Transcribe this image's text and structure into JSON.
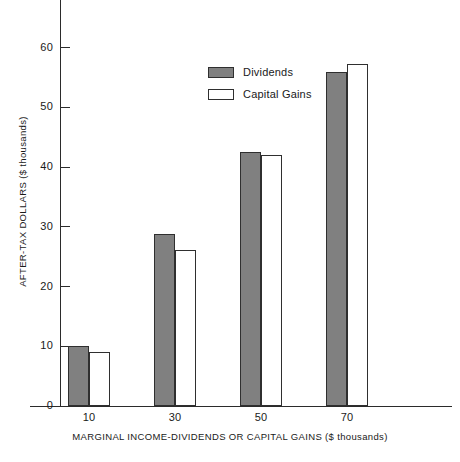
{
  "chart_data": {
    "type": "bar",
    "title": "",
    "subtitle": "",
    "xlabel": "MARGINAL INCOME-DIVIDENDS OR CAPITAL GAINS ($ thousands)",
    "ylabel": "AFTER-TAX DOLLARS ($ thousands)",
    "categories": [
      "10",
      "30",
      "50",
      "70"
    ],
    "series": [
      {
        "name": "Dividends",
        "values": [
          10.0,
          28.8,
          42.6,
          56.0
        ],
        "color": "#808080"
      },
      {
        "name": "Capital Gains",
        "values": [
          9.0,
          26.1,
          42.0,
          57.3
        ],
        "color": "#ffffff"
      }
    ],
    "ylim": [
      0,
      68
    ],
    "yticks": [
      0,
      10,
      20,
      30,
      40,
      50,
      60
    ],
    "ytick_labels": [
      "0",
      "10",
      "20",
      "30",
      "40",
      "50",
      "60"
    ],
    "xtick_labels": [
      "10",
      "30",
      "50",
      "70"
    ],
    "grid": false,
    "legend_position": "upper center",
    "legend": [
      {
        "label": "Dividends",
        "swatch": "filled-gray"
      },
      {
        "label": "Capital Gains",
        "swatch": "outline-white"
      }
    ],
    "axis_color": "#2b2b2b",
    "background": "#ffffff"
  }
}
